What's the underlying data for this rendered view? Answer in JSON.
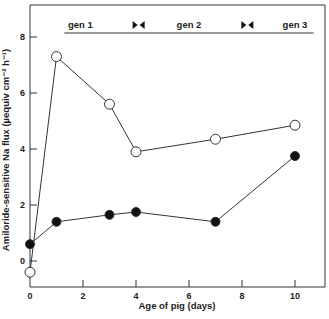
{
  "chart_data": {
    "type": "line",
    "title": "",
    "xlabel": "Age of pig  (days)",
    "ylabel": "Amiloride-sensitive Na flux  (µequiv cm⁻² h⁻¹)",
    "xlim": [
      0,
      11
    ],
    "ylim": [
      -1,
      9
    ],
    "xticks": [
      0,
      2,
      4,
      6,
      8,
      10
    ],
    "xtick_labels": [
      "0",
      "2",
      "4",
      "6",
      "8",
      "10"
    ],
    "yticks": [
      0,
      2,
      4,
      6,
      8
    ],
    "ytick_labels": [
      "0",
      "2",
      "4",
      "6",
      "8"
    ],
    "grid": false,
    "legend": "none",
    "series": [
      {
        "name": "open circles",
        "marker": "open-circle",
        "x": [
          0,
          1,
          3,
          4,
          7,
          10
        ],
        "y": [
          -0.4,
          7.3,
          5.6,
          3.9,
          4.35,
          4.85
        ]
      },
      {
        "name": "filled circles",
        "marker": "filled-circle",
        "x": [
          0,
          1,
          3,
          4,
          7,
          10
        ],
        "y": [
          0.6,
          1.4,
          1.65,
          1.75,
          1.4,
          3.75
        ]
      }
    ],
    "annotations": {
      "generations": [
        {
          "label": "gen 1",
          "x": 1.9
        },
        {
          "label": "gen 2",
          "x": 6.0
        },
        {
          "label": "gen 3",
          "x": 10.0
        }
      ],
      "transfer_markers": [
        {
          "x": 4.1,
          "symbol": "▶◀"
        },
        {
          "x": 8.2,
          "symbol": "▶◀"
        }
      ],
      "generation_bar_range": [
        1.3,
        10.7
      ]
    }
  }
}
